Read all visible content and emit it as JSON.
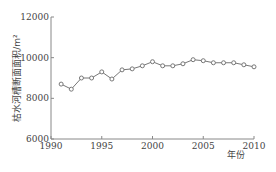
{
  "chart_data": {
    "type": "line",
    "title": "",
    "xlabel": "年份",
    "ylabel": "枯水河槽断面面积/m²",
    "xlim": [
      1990,
      2010
    ],
    "ylim": [
      6000,
      12000
    ],
    "x_ticks": [
      1990,
      1995,
      2000,
      2005,
      2010
    ],
    "y_ticks": [
      6000,
      8000,
      10000,
      12000
    ],
    "grid": false,
    "legend": null,
    "series": [
      {
        "name": "枯水河槽断面面积",
        "marker": "open-circle",
        "color": "#777777",
        "x": [
          1991,
          1992,
          1993,
          1994,
          1995,
          1996,
          1997,
          1998,
          1999,
          2000,
          2001,
          2002,
          2003,
          2004,
          2005,
          2006,
          2007,
          2008,
          2009,
          2010
        ],
        "values": [
          8700,
          8450,
          9000,
          9000,
          9300,
          8950,
          9400,
          9450,
          9600,
          9800,
          9600,
          9600,
          9700,
          9900,
          9850,
          9750,
          9750,
          9750,
          9650,
          9550
        ]
      }
    ]
  },
  "labels": {
    "x_tick_labels": [
      "1990",
      "1995",
      "2000",
      "2005",
      "2010"
    ],
    "y_tick_labels": [
      "6000",
      "8000",
      "10000",
      "12000"
    ],
    "xlabel": "年份",
    "ylabel": "枯水河槽断面面积/m²"
  }
}
